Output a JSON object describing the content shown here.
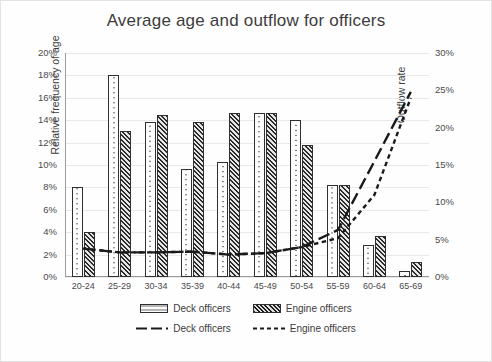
{
  "chart_data": {
    "type": "bar",
    "title": "Average age and outflow for officers",
    "xlabel": "",
    "ylabel": "Relative frequency of age",
    "y2label": "Outflow rate",
    "categories": [
      "20-24",
      "25-29",
      "30-34",
      "35-39",
      "40-44",
      "45-49",
      "50-54",
      "55-59",
      "60-64",
      "65-69"
    ],
    "ylim": [
      0,
      20
    ],
    "y2lim": [
      0,
      30
    ],
    "ytick_labels": [
      "0%",
      "2%",
      "4%",
      "6%",
      "8%",
      "10%",
      "12%",
      "14%",
      "16%",
      "18%",
      "20%"
    ],
    "ytick_values": [
      0,
      2,
      4,
      6,
      8,
      10,
      12,
      14,
      16,
      18,
      20
    ],
    "y2tick_labels": [
      "0%",
      "5%",
      "10%",
      "15%",
      "20%",
      "25%",
      "30%"
    ],
    "y2tick_values": [
      0,
      5,
      10,
      15,
      20,
      25,
      30
    ],
    "grid": true,
    "legend_position": "bottom",
    "bar_series": [
      {
        "name": "Deck officers",
        "axis": "left",
        "fill": "dotted-light",
        "values": [
          8.0,
          18.0,
          13.8,
          9.6,
          10.3,
          14.6,
          14.0,
          8.2,
          2.9,
          0.5
        ]
      },
      {
        "name": "Engine officers",
        "axis": "left",
        "fill": "hatched-dark",
        "values": [
          4.0,
          13.0,
          14.5,
          13.8,
          14.6,
          14.6,
          11.8,
          8.2,
          3.7,
          1.3
        ]
      }
    ],
    "line_series": [
      {
        "name": "Deck officers",
        "axis": "right",
        "style": "dashed",
        "values": [
          3.8,
          3.3,
          3.3,
          3.4,
          3.0,
          3.2,
          4.0,
          6.3,
          15.5,
          24.8
        ]
      },
      {
        "name": "Engine officers",
        "axis": "right",
        "style": "dotted",
        "values": [
          3.8,
          3.3,
          3.3,
          3.4,
          3.0,
          3.2,
          4.0,
          5.2,
          11.0,
          24.0
        ]
      }
    ]
  },
  "legend": {
    "bars": [
      {
        "label": "Deck officers"
      },
      {
        "label": "Engine officers"
      }
    ],
    "lines": [
      {
        "label": "Deck officers"
      },
      {
        "label": "Engine officers"
      }
    ]
  },
  "colors": {
    "bar_deck_fill": "#fdfdfd",
    "bar_engine_fill": "#a8a8a8",
    "bar_outline": "#2f2f2f",
    "line": "#1a1a1a",
    "grid": "#e9e9e9",
    "axis": "#9a9a9a",
    "text": "#3c3c3c",
    "background": "#fefefe"
  }
}
